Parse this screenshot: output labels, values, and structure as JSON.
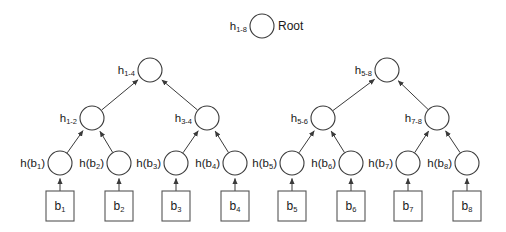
{
  "diagram": {
    "type": "merkle-hash-tree",
    "root_annotation": "Root",
    "levels": 4,
    "leaf_count": 8,
    "colors": {
      "stroke": "#3a3a3a",
      "box_stroke": "#555555",
      "fill": "#ffffff",
      "text": "#1a1a1a",
      "background": "#ffffff"
    },
    "nodes": {
      "root": {
        "id": "h_1_8",
        "label_base": "h",
        "label_sub": "1-8",
        "annotation": "Root",
        "cx": 262,
        "cy": 26,
        "r": 12
      },
      "level2": [
        {
          "id": "h_1_4",
          "label_base": "h",
          "label_sub": "1-4",
          "cx": 150,
          "cy": 70,
          "r": 12
        },
        {
          "id": "h_5_8",
          "label_base": "h",
          "label_sub": "5-8",
          "cx": 387,
          "cy": 70,
          "r": 12
        }
      ],
      "level3": [
        {
          "id": "h_1_2",
          "label_base": "h",
          "label_sub": "1-2",
          "cx": 92,
          "cy": 118,
          "r": 12
        },
        {
          "id": "h_3_4",
          "label_base": "h",
          "label_sub": "3-4",
          "cx": 207,
          "cy": 118,
          "r": 12
        },
        {
          "id": "h_5_6",
          "label_base": "h",
          "label_sub": "5-6",
          "cx": 323,
          "cy": 118,
          "r": 12
        },
        {
          "id": "h_7_8",
          "label_base": "h",
          "label_sub": "7-8",
          "cx": 437,
          "cy": 118,
          "r": 12
        }
      ],
      "leaves": [
        {
          "id": "h_b1",
          "label_base": "h(b",
          "label_sub": "1",
          "label_tail": ")",
          "cx": 60,
          "cy": 163,
          "r": 12
        },
        {
          "id": "h_b2",
          "label_base": "h(b",
          "label_sub": "2",
          "label_tail": ")",
          "cx": 119,
          "cy": 163,
          "r": 12
        },
        {
          "id": "h_b3",
          "label_base": "h(b",
          "label_sub": "3",
          "label_tail": ")",
          "cx": 176,
          "cy": 163,
          "r": 12
        },
        {
          "id": "h_b4",
          "label_base": "h(b",
          "label_sub": "4",
          "label_tail": ")",
          "cx": 235,
          "cy": 163,
          "r": 12
        },
        {
          "id": "h_b5",
          "label_base": "h(b",
          "label_sub": "5",
          "label_tail": ")",
          "cx": 292,
          "cy": 163,
          "r": 12
        },
        {
          "id": "h_b6",
          "label_base": "h(b",
          "label_sub": "6",
          "label_tail": ")",
          "cx": 351,
          "cy": 163,
          "r": 12
        },
        {
          "id": "h_b7",
          "label_base": "h(b",
          "label_sub": "7",
          "label_tail": ")",
          "cx": 408,
          "cy": 163,
          "r": 12
        },
        {
          "id": "h_b8",
          "label_base": "h(b",
          "label_sub": "8",
          "label_tail": ")",
          "cx": 467,
          "cy": 163,
          "r": 12
        }
      ],
      "blocks": [
        {
          "id": "b1",
          "label_base": "b",
          "label_sub": "1",
          "cx": 60,
          "cy": 206,
          "w": 28,
          "h": 30
        },
        {
          "id": "b2",
          "label_base": "b",
          "label_sub": "2",
          "cx": 119,
          "cy": 206,
          "w": 28,
          "h": 30
        },
        {
          "id": "b3",
          "label_base": "b",
          "label_sub": "3",
          "cx": 176,
          "cy": 206,
          "w": 28,
          "h": 30
        },
        {
          "id": "b4",
          "label_base": "b",
          "label_sub": "4",
          "cx": 235,
          "cy": 206,
          "w": 28,
          "h": 30
        },
        {
          "id": "b5",
          "label_base": "b",
          "label_sub": "5",
          "cx": 292,
          "cy": 206,
          "w": 28,
          "h": 30
        },
        {
          "id": "b6",
          "label_base": "b",
          "label_sub": "6",
          "cx": 351,
          "cy": 206,
          "w": 28,
          "h": 30
        },
        {
          "id": "b7",
          "label_base": "b",
          "label_sub": "7",
          "cx": 408,
          "cy": 206,
          "w": 28,
          "h": 30
        },
        {
          "id": "b8",
          "label_base": "b",
          "label_sub": "8",
          "cx": 467,
          "cy": 206,
          "w": 28,
          "h": 30
        }
      ]
    },
    "edges": [
      {
        "from": "h_1_4",
        "to": "root"
      },
      {
        "from": "h_5_8",
        "to": "root"
      },
      {
        "from": "h_1_2",
        "to": "h_1_4"
      },
      {
        "from": "h_3_4",
        "to": "h_1_4"
      },
      {
        "from": "h_5_6",
        "to": "h_5_8"
      },
      {
        "from": "h_7_8",
        "to": "h_5_8"
      },
      {
        "from": "h_b1",
        "to": "h_1_2"
      },
      {
        "from": "h_b2",
        "to": "h_1_2"
      },
      {
        "from": "h_b3",
        "to": "h_3_4"
      },
      {
        "from": "h_b4",
        "to": "h_3_4"
      },
      {
        "from": "h_b5",
        "to": "h_5_6"
      },
      {
        "from": "h_b6",
        "to": "h_5_6"
      },
      {
        "from": "h_b7",
        "to": "h_7_8"
      },
      {
        "from": "h_b8",
        "to": "h_7_8"
      },
      {
        "from": "b1",
        "to": "h_b1"
      },
      {
        "from": "b2",
        "to": "h_b2"
      },
      {
        "from": "b3",
        "to": "h_b3"
      },
      {
        "from": "b4",
        "to": "h_b4"
      },
      {
        "from": "b5",
        "to": "h_b5"
      },
      {
        "from": "b6",
        "to": "h_b6"
      },
      {
        "from": "b7",
        "to": "h_b7"
      },
      {
        "from": "b8",
        "to": "h_b8"
      }
    ]
  }
}
